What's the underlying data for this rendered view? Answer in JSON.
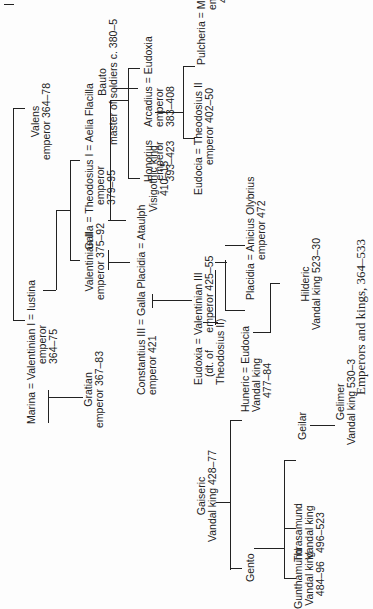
{
  "figure": {
    "caption": "Emperors and kings, 364–533",
    "nodes": {
      "marina": [
        "Marina = Valentinian I = Iustina",
        "emperor",
        "364–75"
      ],
      "valens": [
        "Valens",
        "emperor 364–78"
      ],
      "gratian": [
        "Gratian",
        "emperor 367–83"
      ],
      "valentinian2": [
        "Valentinian II",
        "emperor 375–92"
      ],
      "galla": [
        "Galla = Theodosius I = Aelia Flacilla",
        "emperor",
        "379–95"
      ],
      "constantius": [
        "Constantius III = Galla Placidia = Ataulph",
        "emperor 421"
      ],
      "ataulph": [
        "Visigothic king",
        "410–15"
      ],
      "honorius": [
        "Honorius",
        "emperor",
        "393–423"
      ],
      "arcadius": [
        "Arcadius = Eudoxia",
        "emperor",
        "383–408"
      ],
      "bauto": [
        "Bauto",
        "master of soldiers c. 380–5"
      ],
      "theodosius2": [
        "Eudocia = Theodosius II",
        "emperor 402–50"
      ],
      "pulcheria": [
        "Pulcheria = Marcian",
        "emperor",
        "450–7"
      ],
      "eudoxia": [
        "Eudoxia = Valentinian III",
        "(dt. of      emperor 425–55",
        "Theodosius II)"
      ],
      "placidia": [
        "Placidia = Anicius Olybrius",
        "emperor 472"
      ],
      "huneric": [
        "Huneric = Eudocia",
        "Vandal king",
        "477–84"
      ],
      "hilderic": [
        "Hilderic",
        "Vandal king 523–30"
      ],
      "gaiseric": [
        "Gaiseric",
        "Vandal king 428–77"
      ],
      "gento": [
        "Gento"
      ],
      "gunthamund": [
        "Gunthamund",
        "Vandal king",
        "484–96"
      ],
      "thrasamund": [
        "Thrasamund",
        "Vandal king",
        "496–523"
      ],
      "geilar": [
        "Geilar"
      ],
      "gelimer": [
        "Gelimer",
        "Vandal king 530–3"
      ]
    }
  }
}
